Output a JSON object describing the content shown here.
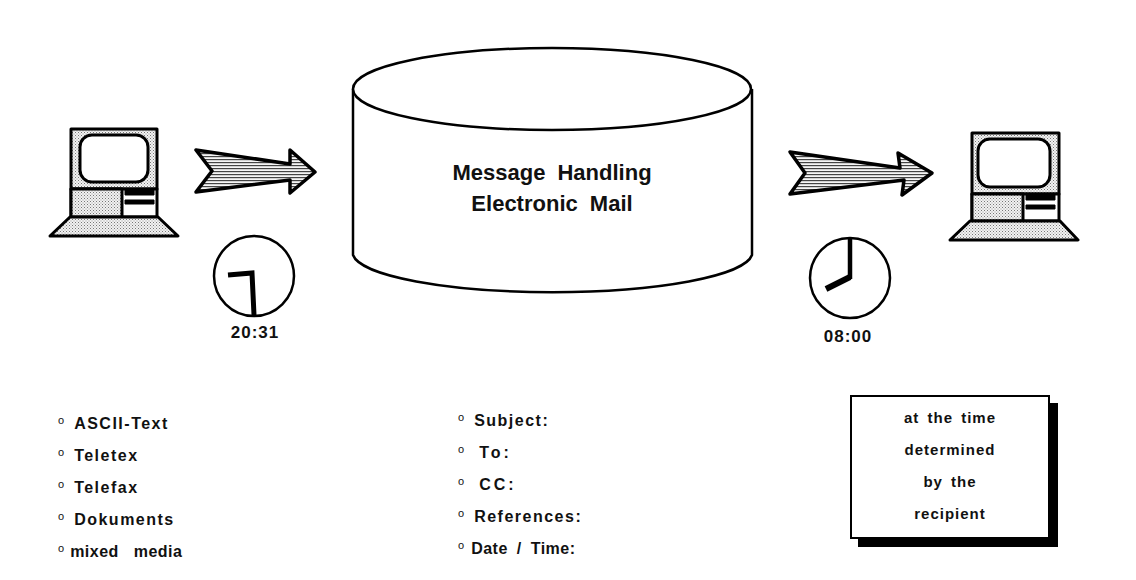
{
  "diagram": {
    "central_store": {
      "line1": "Message  Handling",
      "line2": "Electronic  Mail",
      "shape": "cylinder"
    },
    "sender": {
      "icon": "computer-icon",
      "arrow_icon": "arrow-right-icon",
      "clock_icon": "clock-icon",
      "time": "20:31"
    },
    "recipient": {
      "icon": "computer-icon",
      "arrow_icon": "arrow-right-icon",
      "clock_icon": "clock-icon",
      "time": "08:00"
    },
    "content_types": {
      "bullet": "o",
      "items": [
        {
          "label": "ASCII-Text"
        },
        {
          "label": "Teletex"
        },
        {
          "label": "Telefax"
        },
        {
          "label": "Dokuments"
        },
        {
          "label": "mixed   media"
        }
      ]
    },
    "header_fields": {
      "bullet": "o",
      "items": [
        {
          "label": "Subject:"
        },
        {
          "label": "To:"
        },
        {
          "label": "CC:"
        },
        {
          "label": "References:"
        },
        {
          "label": "Date / Time:"
        }
      ]
    },
    "delivery_note": {
      "lines": [
        "at the time",
        "determined",
        "by  the",
        "recipient"
      ]
    },
    "colors": {
      "stroke": "#000000",
      "fill_shade": "#d8d8d8",
      "background": "#ffffff"
    }
  }
}
